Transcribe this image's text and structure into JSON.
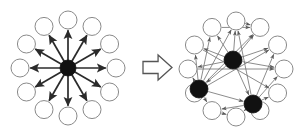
{
  "figure": {
    "type": "diagram",
    "title": "",
    "background_color": "#ffffff",
    "width": 297,
    "height": 132,
    "colors": {
      "node_outline": "#8a8a8a",
      "node_fill_hollow": "#ffffff",
      "node_fill_solid": "#111111",
      "edge_left": "#2b2b2b",
      "edge_right": "#6e6e6e",
      "transform_arrow_stroke": "#555555",
      "transform_arrow_fill": "#ffffff"
    }
  },
  "panels": [
    {
      "id": "left-panel",
      "name": "star-topology",
      "label": "",
      "center": {
        "cx": 68,
        "cy": 68
      },
      "ring_radius": 48,
      "node_radius": 9,
      "hub": {
        "cx": 68,
        "cy": 68,
        "r": 8,
        "fill": "solid"
      },
      "edge_style": "thick-directed-outward",
      "nodes": [
        {
          "id": "L1",
          "angle": -90,
          "cx": 68,
          "cy": 20,
          "fill": "hollow"
        },
        {
          "id": "L2",
          "angle": -60,
          "cx": 92,
          "cy": 26.43,
          "fill": "hollow"
        },
        {
          "id": "L3",
          "angle": -30,
          "cx": 109.57,
          "cy": 44,
          "fill": "hollow"
        },
        {
          "id": "L4",
          "angle": 0,
          "cx": 116,
          "cy": 68,
          "fill": "hollow"
        },
        {
          "id": "L5",
          "angle": 30,
          "cx": 109.57,
          "cy": 92,
          "fill": "hollow"
        },
        {
          "id": "L6",
          "angle": 60,
          "cx": 92,
          "cy": 109.57,
          "fill": "hollow"
        },
        {
          "id": "L7",
          "angle": 90,
          "cx": 68,
          "cy": 116,
          "fill": "hollow"
        },
        {
          "id": "L8",
          "angle": 120,
          "cx": 44,
          "cy": 109.57,
          "fill": "hollow"
        },
        {
          "id": "L9",
          "angle": 150,
          "cx": 26.43,
          "cy": 92,
          "fill": "hollow"
        },
        {
          "id": "L10",
          "angle": 180,
          "cx": 20,
          "cy": 68,
          "fill": "hollow"
        },
        {
          "id": "L11",
          "angle": 210,
          "cx": 26.43,
          "cy": 44,
          "fill": "hollow"
        },
        {
          "id": "L12",
          "angle": 240,
          "cx": 44,
          "cy": 26.43,
          "fill": "hollow"
        }
      ],
      "edges": [
        {
          "from": "hub",
          "to": "L1",
          "directed": true
        },
        {
          "from": "hub",
          "to": "L2",
          "directed": true
        },
        {
          "from": "hub",
          "to": "L3",
          "directed": true
        },
        {
          "from": "hub",
          "to": "L4",
          "directed": true
        },
        {
          "from": "hub",
          "to": "L5",
          "directed": true
        },
        {
          "from": "hub",
          "to": "L6",
          "directed": true
        },
        {
          "from": "hub",
          "to": "L7",
          "directed": true
        },
        {
          "from": "hub",
          "to": "L8",
          "directed": true
        },
        {
          "from": "hub",
          "to": "L9",
          "directed": true
        },
        {
          "from": "hub",
          "to": "L10",
          "directed": true
        },
        {
          "from": "hub",
          "to": "L11",
          "directed": true
        },
        {
          "from": "hub",
          "to": "L12",
          "directed": true
        }
      ]
    },
    {
      "id": "right-panel",
      "name": "distributed-topology",
      "label": "",
      "center": {
        "cx": 236,
        "cy": 69
      },
      "ring_radius": 48,
      "node_radius": 9,
      "edge_style": "thin-directed-mesh",
      "nodes": [
        {
          "id": "R1",
          "angle": -90,
          "cx": 236,
          "cy": 21,
          "fill": "hollow"
        },
        {
          "id": "R2",
          "angle": -60,
          "cx": 260,
          "cy": 27.43,
          "fill": "hollow"
        },
        {
          "id": "R3",
          "angle": -30,
          "cx": 277.57,
          "cy": 45,
          "fill": "hollow"
        },
        {
          "id": "R4",
          "angle": 0,
          "cx": 284,
          "cy": 69,
          "fill": "hollow"
        },
        {
          "id": "R5",
          "angle": 30,
          "cx": 277.57,
          "cy": 93,
          "fill": "hollow"
        },
        {
          "id": "R6",
          "angle": 60,
          "cx": 260,
          "cy": 110.57,
          "fill": "hollow"
        },
        {
          "id": "R7",
          "angle": 90,
          "cx": 236,
          "cy": 117,
          "fill": "hollow"
        },
        {
          "id": "R8",
          "angle": 120,
          "cx": 212,
          "cy": 110.57,
          "fill": "hollow"
        },
        {
          "id": "R9",
          "angle": 150,
          "cx": 194.43,
          "cy": 93,
          "fill": "hollow"
        },
        {
          "id": "R10",
          "angle": 180,
          "cx": 188,
          "cy": 69,
          "fill": "hollow"
        },
        {
          "id": "R11",
          "angle": 210,
          "cx": 194.43,
          "cy": 45,
          "fill": "hollow"
        },
        {
          "id": "R12",
          "angle": 240,
          "cx": 212,
          "cy": 27.43,
          "fill": "hollow"
        },
        {
          "id": "RS1",
          "angle": null,
          "cx": 233,
          "cy": 60,
          "fill": "solid"
        },
        {
          "id": "RS2",
          "angle": null,
          "cx": 199,
          "cy": 89,
          "fill": "solid"
        },
        {
          "id": "RS3",
          "angle": null,
          "cx": 253,
          "cy": 104,
          "fill": "solid"
        }
      ],
      "edges": [
        {
          "from": "RS1",
          "to": "R1",
          "directed": true
        },
        {
          "from": "RS1",
          "to": "R2",
          "directed": true
        },
        {
          "from": "RS1",
          "to": "R3",
          "directed": true
        },
        {
          "from": "RS1",
          "to": "R4",
          "directed": true
        },
        {
          "from": "RS1",
          "to": "R11",
          "directed": true
        },
        {
          "from": "RS1",
          "to": "R12",
          "directed": true
        },
        {
          "from": "RS1",
          "to": "R10",
          "directed": true
        },
        {
          "from": "RS2",
          "to": "R9",
          "directed": true
        },
        {
          "from": "RS2",
          "to": "R10",
          "directed": true
        },
        {
          "from": "RS2",
          "to": "R11",
          "directed": true
        },
        {
          "from": "RS2",
          "to": "R12",
          "directed": true
        },
        {
          "from": "RS2",
          "to": "R1",
          "directed": true
        },
        {
          "from": "RS2",
          "to": "R2",
          "directed": true
        },
        {
          "from": "RS2",
          "to": "R8",
          "directed": true
        },
        {
          "from": "RS3",
          "to": "R5",
          "directed": true
        },
        {
          "from": "RS3",
          "to": "R6",
          "directed": true
        },
        {
          "from": "RS3",
          "to": "R7",
          "directed": true
        },
        {
          "from": "RS3",
          "to": "R8",
          "directed": true
        },
        {
          "from": "RS3",
          "to": "R4",
          "directed": true
        },
        {
          "from": "RS3",
          "to": "R1",
          "directed": true
        },
        {
          "from": "RS3",
          "to": "R3",
          "directed": true
        },
        {
          "from": "RS1",
          "to": "RS2",
          "directed": true
        },
        {
          "from": "RS1",
          "to": "RS3",
          "directed": true
        },
        {
          "from": "RS2",
          "to": "RS3",
          "directed": true
        },
        {
          "from": "R12",
          "to": "R2",
          "directed": true
        },
        {
          "from": "R1",
          "to": "R2",
          "directed": true
        },
        {
          "from": "R10",
          "to": "R4",
          "directed": true
        },
        {
          "from": "R9",
          "to": "R3",
          "directed": true
        },
        {
          "from": "R11",
          "to": "R5",
          "directed": true
        },
        {
          "from": "R8",
          "to": "R7",
          "directed": true
        }
      ]
    }
  ],
  "transform_arrow": {
    "name": "transform-arrow",
    "direction": "right",
    "label": "",
    "x": 143,
    "y": 55,
    "width": 29,
    "height": 25
  }
}
